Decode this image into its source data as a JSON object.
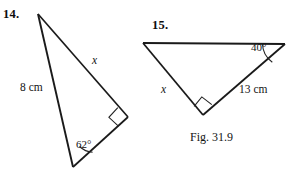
{
  "page": {
    "width": 293,
    "height": 173,
    "background": "#ffffff",
    "ink_color": "#1a1a1a"
  },
  "caption": {
    "text": "Fig. 31.9"
  },
  "figures": [
    {
      "number_label": "14.",
      "shape": "right-triangle",
      "vertices": {
        "apex_top": [
          38,
          14
        ],
        "bottom": [
          73,
          167
        ],
        "right_angle": [
          128,
          117
        ]
      },
      "labels": {
        "hypotenuse_side": "8 cm",
        "unknown_side": "x",
        "angle": "62°"
      },
      "right_angle_marker_at": "right_angle"
    },
    {
      "number_label": "15.",
      "shape": "right-triangle",
      "vertices": {
        "top_left": [
          143,
          43
        ],
        "top_right": [
          285,
          44
        ],
        "right_angle": [
          203,
          115
        ]
      },
      "labels": {
        "unknown_side": "x",
        "known_side": "13 cm",
        "angle": "40°"
      },
      "right_angle_marker_at": "right_angle"
    }
  ]
}
